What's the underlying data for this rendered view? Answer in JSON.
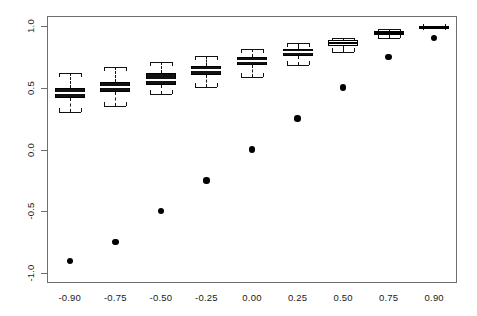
{
  "chart_data": {
    "type": "boxplot",
    "title": "",
    "subtitle": "",
    "xlabel": "",
    "ylabel": "",
    "categories": [
      "-0.90",
      "-0.75",
      "-0.50",
      "-0.25",
      "0.00",
      "0.25",
      "0.50",
      "0.75",
      "0.90"
    ],
    "x_tick_labels": [
      "-0.90",
      "-0.75",
      "-0.50",
      "-0.25",
      "0.00",
      "0.25",
      "0.50",
      "0.75",
      "0.90"
    ],
    "y_tick_labels": [
      "-1.0",
      "-0.5",
      "0.0",
      "0.5",
      "1.0"
    ],
    "y_ticks": [
      -1.0,
      -0.5,
      0.0,
      0.5,
      1.0
    ],
    "ylim": [
      -1.08,
      1.08
    ],
    "grid": false,
    "legend": false,
    "legend_position": "none",
    "box_fill": "#111111",
    "median_color": "#ffffff",
    "point_color": "#000000",
    "axis_color": "#6e6e6e",
    "boxes": [
      {
        "category": "-0.90",
        "lower_whisker": 0.3,
        "q1": 0.415,
        "median": 0.455,
        "q3": 0.495,
        "upper_whisker": 0.615,
        "filled": true
      },
      {
        "category": "-0.75",
        "lower_whisker": 0.355,
        "q1": 0.465,
        "median": 0.505,
        "q3": 0.545,
        "upper_whisker": 0.665,
        "filled": true
      },
      {
        "category": "-0.50",
        "lower_whisker": 0.445,
        "q1": 0.525,
        "median": 0.565,
        "q3": 0.615,
        "upper_whisker": 0.705,
        "filled": true
      },
      {
        "category": "-0.25",
        "lower_whisker": 0.505,
        "q1": 0.605,
        "median": 0.64,
        "q3": 0.675,
        "upper_whisker": 0.755,
        "filled": true
      },
      {
        "category": "0.00",
        "lower_whisker": 0.585,
        "q1": 0.68,
        "median": 0.715,
        "q3": 0.745,
        "upper_whisker": 0.815,
        "filled": true
      },
      {
        "category": "0.25",
        "lower_whisker": 0.68,
        "q1": 0.76,
        "median": 0.79,
        "q3": 0.815,
        "upper_whisker": 0.865,
        "filled": true
      },
      {
        "category": "0.50",
        "lower_whisker": 0.785,
        "q1": 0.84,
        "median": 0.862,
        "q3": 0.885,
        "upper_whisker": 0.905,
        "filled": false
      },
      {
        "category": "0.75",
        "lower_whisker": 0.905,
        "q1": 0.93,
        "median": 0.945,
        "q3": 0.958,
        "upper_whisker": 0.975,
        "filled": false
      },
      {
        "category": "0.90",
        "lower_whisker": 0.982,
        "q1": 0.988,
        "median": 0.993,
        "q3": 0.998,
        "upper_whisker": 1.002,
        "filled": false
      }
    ],
    "points": [
      {
        "category": "-0.90",
        "value": -0.9
      },
      {
        "category": "-0.75",
        "value": -0.75
      },
      {
        "category": "-0.50",
        "value": -0.5
      },
      {
        "category": "-0.25",
        "value": -0.25
      },
      {
        "category": "0.00",
        "value": 0.0
      },
      {
        "category": "0.25",
        "value": 0.25
      },
      {
        "category": "0.50",
        "value": 0.5
      },
      {
        "category": "0.75",
        "value": 0.75
      },
      {
        "category": "0.90",
        "value": 0.9
      }
    ],
    "points_series_name": "true value"
  },
  "layout": {
    "plot_left": 47,
    "plot_right": 457,
    "plot_top": 16,
    "plot_bottom": 283
  }
}
